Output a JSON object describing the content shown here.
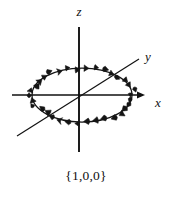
{
  "figure": {
    "caption": "{1,0,0}",
    "axes": [
      {
        "id": "z",
        "label": "z",
        "label_x": 79,
        "label_y": 16,
        "orientation": "vertical"
      },
      {
        "id": "y",
        "label": "y",
        "label_x": 148,
        "label_y": 61,
        "orientation": "diagonal"
      },
      {
        "id": "x",
        "label": "x",
        "label_x": 158,
        "label_y": 107,
        "orientation": "horizontal"
      }
    ],
    "colors": {
      "background": "#ffffff",
      "ink": "#111111",
      "ring": "#141414"
    }
  },
  "chart_data": {
    "type": "scatter",
    "title": "{1,0,0}",
    "xlabel": "x",
    "ylabel": "y",
    "zlabel": "z",
    "axis_labels": [
      "z",
      "y",
      "x"
    ],
    "annotations": [
      "{1,0,0}"
    ],
    "grid": false,
    "legend": "none",
    "origin": {
      "x": 81,
      "y": 95
    },
    "ring": {
      "center_x": 82,
      "center_y": 95,
      "radius_x": 50,
      "radius_y": 27,
      "arrow_count": 34,
      "sense": "counterclockwise"
    },
    "axis_segments": [
      {
        "name": "z",
        "x1": 79,
        "y1": 27,
        "x2": 79,
        "y2": 152
      },
      {
        "name": "x",
        "x1": 12,
        "y1": 95,
        "x2": 144,
        "y2": 95
      },
      {
        "name": "y",
        "x1": 17,
        "y1": 136,
        "x2": 139,
        "y2": 59
      }
    ]
  }
}
